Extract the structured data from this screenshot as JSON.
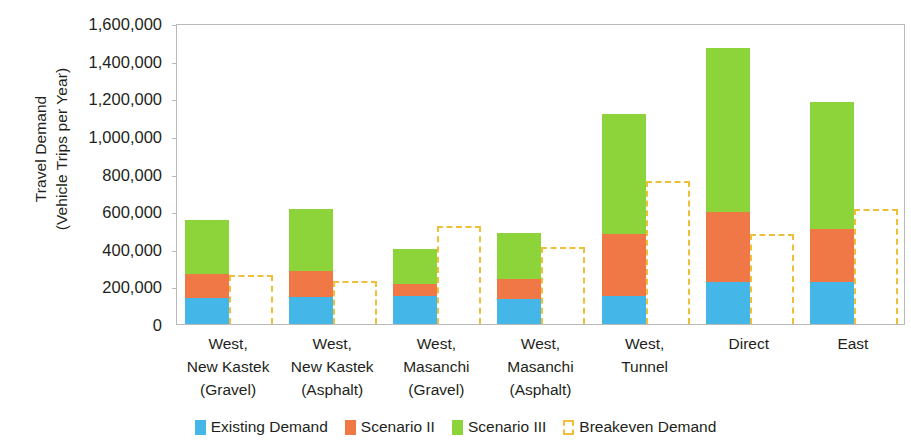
{
  "chart_data": {
    "type": "bar",
    "title": "",
    "subtitle": "",
    "xlabel": "",
    "ylabel": "Travel Demand (Vehicle Trips per Year)",
    "ylabel_lines": [
      "Travel Demand",
      "(Vehicle Trips per Year)"
    ],
    "ylim": [
      0,
      1600000
    ],
    "ytick_step": 200000,
    "ytick_labels": [
      "1,600,000",
      "1,400,000",
      "1,200,000",
      "1,000,000",
      "800,000",
      "600,000",
      "400,000",
      "200,000",
      "0"
    ],
    "ytick_values": [
      1600000,
      1400000,
      1200000,
      1000000,
      800000,
      600000,
      400000,
      200000,
      0
    ],
    "grid": false,
    "stacked": true,
    "legend_position": "bottom",
    "categories": [
      "West, New Kastek (Gravel)",
      "West, New Kastek (Asphalt)",
      "West, Masanchi (Gravel)",
      "West, Masanchi (Asphalt)",
      "West, Tunnel",
      "Direct",
      "East"
    ],
    "category_lines": [
      [
        "West,",
        "New Kastek",
        "(Gravel)"
      ],
      [
        "West,",
        "New Kastek",
        "(Asphalt)"
      ],
      [
        "West,",
        "Masanchi",
        "(Gravel)"
      ],
      [
        "West,",
        "Masanchi",
        "(Asphalt)"
      ],
      [
        "West,",
        "Tunnel"
      ],
      [
        "Direct"
      ],
      [
        "East"
      ]
    ],
    "series": [
      {
        "name": "Existing Demand",
        "color": "#45B6E8",
        "style": "solid",
        "values": [
          140000,
          145000,
          150000,
          135000,
          150000,
          225000,
          225000
        ]
      },
      {
        "name": "Scenario II",
        "color": "#F07746",
        "style": "solid",
        "values": [
          125000,
          135000,
          65000,
          105000,
          330000,
          370000,
          280000
        ]
      },
      {
        "name": "Scenario III",
        "color": "#8DD43A",
        "style": "solid",
        "values": [
          290000,
          330000,
          185000,
          245000,
          635000,
          870000,
          675000
        ]
      },
      {
        "name": "Breakeven Demand",
        "color": "#F0BF3A",
        "style": "dashed-outline",
        "values": [
          260000,
          230000,
          520000,
          410000,
          760000,
          480000,
          612000
        ]
      }
    ],
    "stack_totals": [
      555000,
      610000,
      400000,
      485000,
      1115000,
      1465000,
      1180000
    ]
  },
  "legend": {
    "items": [
      {
        "label": "Existing Demand",
        "color": "#45B6E8",
        "style": "solid"
      },
      {
        "label": "Scenario II",
        "color": "#F07746",
        "style": "solid"
      },
      {
        "label": "Scenario III",
        "color": "#8DD43A",
        "style": "solid"
      },
      {
        "label": "Breakeven Demand",
        "color": "#F0BF3A",
        "style": "dashed-outline"
      }
    ]
  },
  "colors": {
    "existing_demand": "#45B6E8",
    "scenario_ii": "#F07746",
    "scenario_iii": "#8DD43A",
    "breakeven": "#F0BF3A",
    "axis": "#B9B9B9",
    "text": "#231F20",
    "background": "#FFFFFF"
  }
}
